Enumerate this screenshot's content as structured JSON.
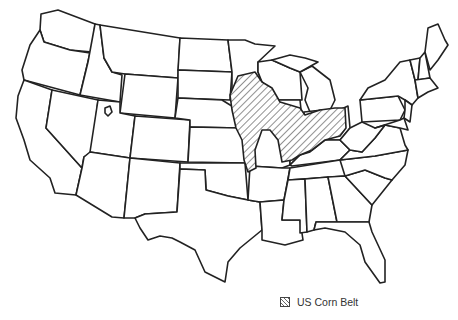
{
  "map": {
    "title": "",
    "region": "Contiguous United States",
    "highlighted_region": "US Corn Belt",
    "highlighted_states": [
      "Iowa",
      "Illinois",
      "Indiana",
      "Ohio",
      "Missouri (north)",
      "Minnesota (south)",
      "Nebraska (east)",
      "South Dakota (southeast)",
      "Kansas (east)",
      "Wisconsin (southwest)"
    ],
    "colors": {
      "outline": "#222222",
      "fill": "#ffffff",
      "hatch": "#555555"
    }
  },
  "legend": {
    "items": [
      {
        "label": "US Corn Belt",
        "pattern": "diagonal-hatch"
      }
    ]
  }
}
